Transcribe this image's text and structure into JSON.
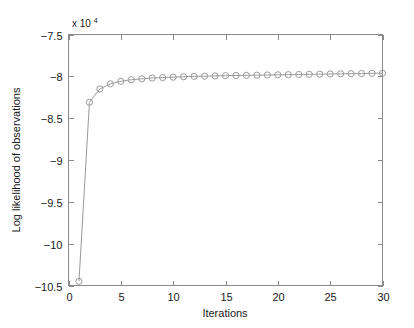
{
  "chart_data": {
    "type": "line",
    "title": "",
    "subtitle": "",
    "xlabel": "Iterations",
    "ylabel": "Log likelihood of observations",
    "y_multiplier_label": "x 10",
    "y_multiplier_exponent": "4",
    "y_multiplier_value": 10000,
    "xlim": [
      0,
      30
    ],
    "ylim": [
      -10.5,
      -7.5
    ],
    "xticks": [
      0,
      5,
      10,
      15,
      20,
      25,
      30
    ],
    "xtick_labels": [
      "0",
      "5",
      "10",
      "15",
      "20",
      "25",
      "30"
    ],
    "yticks": [
      -10.5,
      -10,
      -9.5,
      -9,
      -8.5,
      -8,
      -7.5
    ],
    "ytick_labels": [
      "-10.5",
      "-10",
      "-9.5",
      "-9",
      "-8.5",
      "-8",
      "-7.5"
    ],
    "grid": false,
    "legend": null,
    "marker": "circle",
    "line_color": "#9a9a9a",
    "marker_color": "#9a9a9a",
    "axis_color": "#8a8a8a",
    "background_color": "#ffffff",
    "series": [
      {
        "name": "Log likelihood",
        "x": [
          1,
          2,
          3,
          4,
          5,
          6,
          7,
          8,
          9,
          10,
          11,
          12,
          13,
          14,
          15,
          16,
          17,
          18,
          19,
          20,
          21,
          22,
          23,
          24,
          25,
          26,
          27,
          28,
          29,
          30
        ],
        "values": [
          -10.45,
          -8.31,
          -8.15,
          -8.09,
          -8.06,
          -8.04,
          -8.03,
          -8.02,
          -8.015,
          -8.01,
          -8.005,
          -8.0,
          -7.998,
          -7.995,
          -7.992,
          -7.99,
          -7.988,
          -7.986,
          -7.984,
          -7.982,
          -7.98,
          -7.978,
          -7.976,
          -7.974,
          -7.972,
          -7.97,
          -7.968,
          -7.966,
          -7.964,
          -7.962
        ]
      }
    ]
  }
}
